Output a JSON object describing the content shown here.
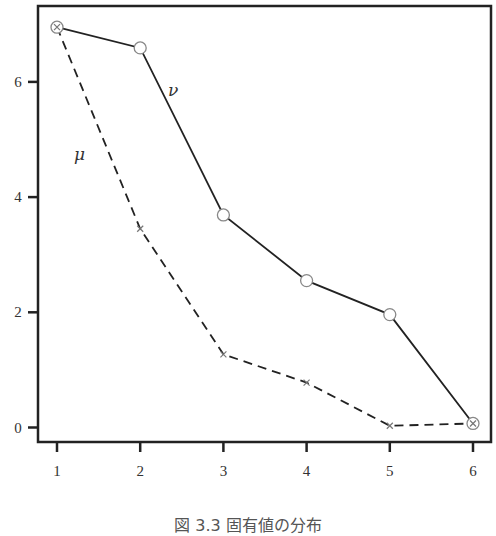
{
  "chart_data": {
    "type": "line",
    "title": "",
    "xlabel": "",
    "ylabel": "",
    "x": [
      1,
      2,
      3,
      4,
      5,
      6
    ],
    "xticks": [
      "1",
      "2",
      "3",
      "4",
      "5",
      "6"
    ],
    "yticks": [
      "0",
      "2",
      "4",
      "6"
    ],
    "ylim": [
      -0.25,
      7.5
    ],
    "xlim": [
      0.8,
      6.25
    ],
    "grid": false,
    "legend": "inline labels",
    "series": [
      {
        "name": "ν",
        "style": "solid",
        "marker": "circle",
        "values": [
          6.95,
          6.59,
          3.69,
          2.55,
          1.96,
          0.07
        ]
      },
      {
        "name": "μ",
        "style": "dashed",
        "marker": "x",
        "values": [
          6.95,
          3.45,
          1.27,
          0.78,
          0.03,
          0.07
        ]
      }
    ],
    "annotations": [
      {
        "text": "ν",
        "x": 2.45,
        "y": 6.0
      },
      {
        "text": "μ",
        "x": 1.3,
        "y": 4.75
      }
    ]
  },
  "caption": "図 3.3 固有値の分布"
}
